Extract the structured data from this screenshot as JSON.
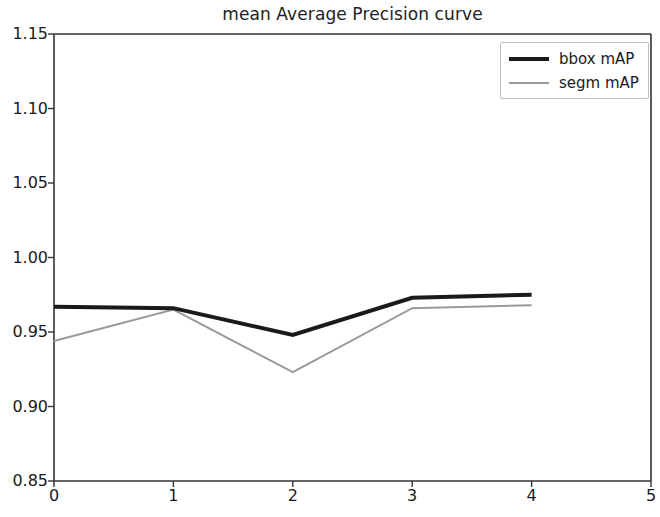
{
  "chart_data": {
    "type": "line",
    "title": "mean Average Precision curve",
    "xlabel": "",
    "ylabel": "",
    "x": [
      0,
      1,
      2,
      3,
      4
    ],
    "xlim": [
      0,
      5
    ],
    "ylim": [
      0.85,
      1.15
    ],
    "xticks": [
      "0",
      "1",
      "2",
      "3",
      "4",
      "5"
    ],
    "yticks": [
      "0.85",
      "0.90",
      "0.95",
      "1.00",
      "1.05",
      "1.10",
      "1.15"
    ],
    "grid": false,
    "legend_position": "upper right",
    "series": [
      {
        "name": "bbox mAP",
        "color": "#1a1a1a",
        "linewidth": 4,
        "values": [
          0.967,
          0.966,
          0.948,
          0.973,
          0.975
        ]
      },
      {
        "name": "segm mAP",
        "color": "#9a9a9a",
        "linewidth": 2,
        "values": [
          0.944,
          0.965,
          0.923,
          0.966,
          0.968
        ]
      }
    ]
  },
  "axes": {
    "spine_color": "#333333",
    "background": "#ffffff"
  }
}
